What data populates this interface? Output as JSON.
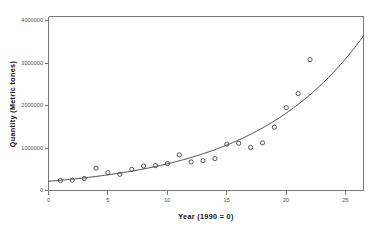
{
  "chart_data": {
    "type": "scatter",
    "title": "",
    "xlabel": "Year (1990 = 0)",
    "ylabel": "Quantity (Metric tones)",
    "xlim": [
      0,
      26.5
    ],
    "ylim": [
      0,
      4200000
    ],
    "grid": false,
    "legend": null,
    "xticks": [
      0,
      5,
      10,
      15,
      20,
      25
    ],
    "xticklabels": [
      "0",
      "5",
      "10",
      "15",
      "20",
      "25"
    ],
    "yticks": [
      0,
      1000000,
      2000000,
      3000000,
      4000000
    ],
    "yticklabels": [
      "0",
      "1000000",
      "2000000",
      "3000000",
      "4000000"
    ],
    "series": [
      {
        "name": "Observed quantity",
        "marker": "open-circle",
        "color": "#3b3b3b",
        "x": [
          1,
          2,
          3,
          4,
          5,
          6,
          7,
          8,
          9,
          10,
          11,
          12,
          13,
          14,
          15,
          16,
          17,
          18,
          19,
          20,
          21,
          22
        ],
        "y": [
          240000,
          250000,
          290000,
          540000,
          430000,
          390000,
          510000,
          590000,
          600000,
          650000,
          860000,
          690000,
          720000,
          770000,
          1120000,
          1140000,
          1040000,
          1150000,
          1530000,
          2000000,
          2340000,
          3160000
        ]
      },
      {
        "name": "Exponential fit",
        "type": "line",
        "color": "#3b3b3b",
        "equation": "y = 222000 * exp(0.1065 * x)",
        "x_range": [
          0,
          26.5
        ]
      }
    ]
  },
  "axes": {
    "x_label": "Year (1990 = 0)",
    "y_label": "Quantity (Metric tones)"
  }
}
